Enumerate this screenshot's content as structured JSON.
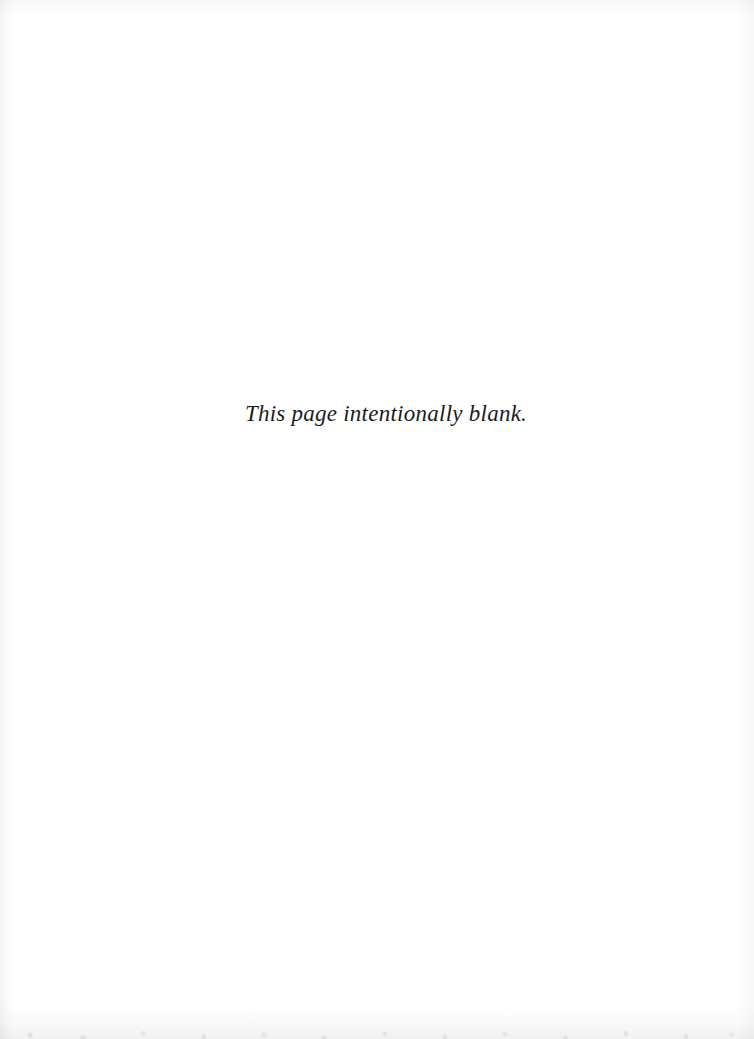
{
  "page": {
    "kind": "scanned-book-page",
    "background_color": "#ffffff",
    "ink_color": "#1b1b1f",
    "body": {
      "notice_text": "This page intentionally blank."
    },
    "header_text": "",
    "footer_text": "",
    "page_number": "",
    "artifacts": {
      "left_edge_shadow": "faint vertical gray gradient along left edge",
      "right_edge_shadow": "faint vertical gray gradient along right edge",
      "top_edge_shadow": "faint horizontal gray gradient along top edge",
      "bottom_edge_shadow": "mottled gray scan band along bottom edge"
    }
  }
}
